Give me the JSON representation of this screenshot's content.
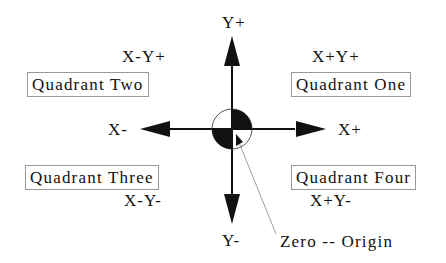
{
  "diagram": {
    "axes": {
      "y_positive": "Y+",
      "y_negative": "Y-",
      "x_positive": "X+",
      "x_negative": "X-"
    },
    "quadrants": [
      {
        "name": "Quadrant One",
        "signs": "X+Y+"
      },
      {
        "name": "Quadrant Two",
        "signs": "X-Y+"
      },
      {
        "name": "Quadrant Three",
        "signs": "X-Y-"
      },
      {
        "name": "Quadrant Four",
        "signs": "X+Y-"
      }
    ],
    "origin_label": "Zero -- Origin",
    "colors": {
      "ink": "#111111",
      "box_border": "#999999",
      "leader_line": "#888888"
    }
  }
}
